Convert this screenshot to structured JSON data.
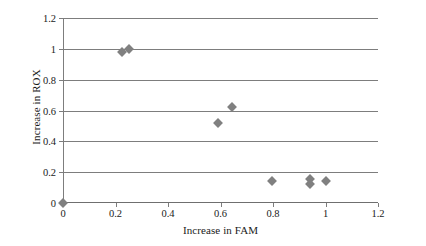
{
  "chart_data": {
    "type": "scatter",
    "title": "",
    "xlabel": "Increase in FAM",
    "ylabel": "Increase in ROX",
    "xlim": [
      0,
      1.2
    ],
    "ylim": [
      0,
      1.2
    ],
    "xticks": [
      "0",
      "0.2",
      "0.4",
      "0.6",
      "0.8",
      "1",
      "1.2"
    ],
    "xtick_values": [
      0,
      0.2,
      0.4,
      0.6,
      0.8,
      1,
      1.2
    ],
    "yticks": [
      "0",
      "0.2",
      "0.4",
      "0.6",
      "0.8",
      "1",
      "1.2"
    ],
    "ytick_values": [
      0,
      0.2,
      0.4,
      0.6,
      0.8,
      1,
      1.2
    ],
    "grid": "horizontal",
    "legend": "none",
    "marker": "diamond",
    "marker_color": "#808080",
    "axis_color": "#7d7d7d",
    "points": [
      {
        "x": 0,
        "y": 0
      },
      {
        "x": 0.225,
        "y": 0.98
      },
      {
        "x": 0.25,
        "y": 1.0
      },
      {
        "x": 0.59,
        "y": 0.52
      },
      {
        "x": 0.645,
        "y": 0.62
      },
      {
        "x": 0.795,
        "y": 0.145
      },
      {
        "x": 0.94,
        "y": 0.155
      },
      {
        "x": 0.94,
        "y": 0.125
      },
      {
        "x": 1.0,
        "y": 0.145
      }
    ]
  }
}
